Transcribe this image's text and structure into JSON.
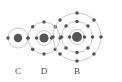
{
  "figure": {
    "background_color": "#ffffff",
    "width": 122,
    "height": 82,
    "shell_color": "#c9c9c9",
    "electron_color": "#555555",
    "nucleus_color": "#565656",
    "label_color": "#4a4a4a"
  },
  "atoms": [
    {
      "label": "C",
      "label_x": 18,
      "label_y": 66,
      "cx": 18,
      "cy": 38,
      "nucleus_r": 4.2,
      "shell_count": 1,
      "shells": [
        {
          "radius": 10,
          "electrons": 2,
          "start_angle": 0
        }
      ],
      "electron_r": 1.7
    },
    {
      "label": "D",
      "label_x": 44,
      "label_y": 66,
      "cx": 44,
      "cy": 38,
      "nucleus_r": 4.6,
      "shell_count": 2,
      "shells": [
        {
          "radius": 7.5,
          "electrons": 2,
          "start_angle": 0
        },
        {
          "radius": 16,
          "electrons": 8,
          "start_angle": 0
        }
      ],
      "electron_r": 1.7
    },
    {
      "label": "B",
      "label_x": 77,
      "label_y": 66,
      "cx": 77,
      "cy": 37,
      "nucleus_r": 5.0,
      "shell_count": 3,
      "shells": [
        {
          "radius": 7.5,
          "electrons": 2,
          "start_angle": 0
        },
        {
          "radius": 15.5,
          "electrons": 8,
          "start_angle": 0
        },
        {
          "radius": 24,
          "electrons": 8,
          "start_angle": 0
        }
      ],
      "electron_r": 1.8
    }
  ]
}
